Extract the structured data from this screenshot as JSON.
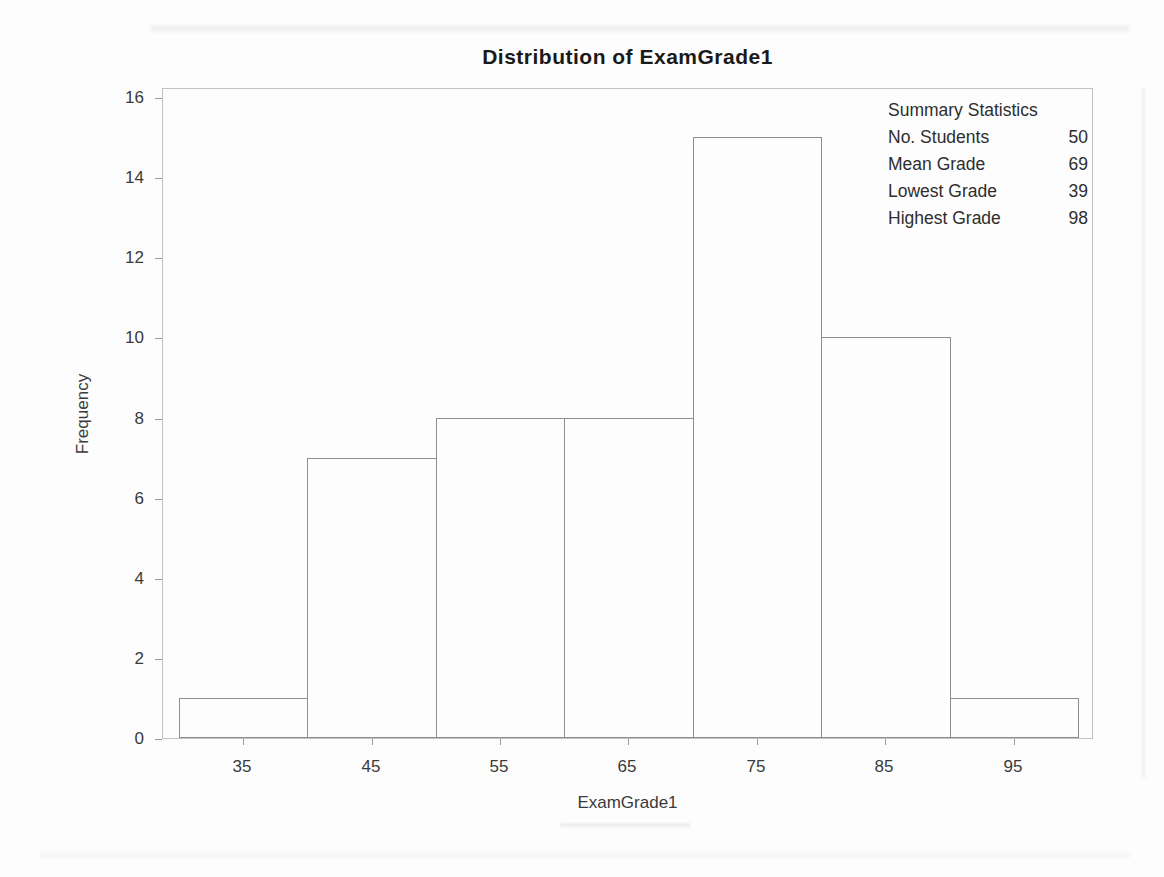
{
  "chart_data": {
    "type": "bar",
    "subtype": "histogram",
    "title": "Distribution of ExamGrade1",
    "xlabel": "ExamGrade1",
    "ylabel": "Frequency",
    "categories": [
      35,
      45,
      55,
      65,
      75,
      85,
      95
    ],
    "values": [
      1,
      7,
      8,
      8,
      15,
      10,
      1
    ],
    "bin_width": 10,
    "x_bin_edges": [
      30,
      40,
      50,
      60,
      70,
      80,
      90,
      100
    ],
    "x_tick_labels": [
      "35",
      "45",
      "55",
      "65",
      "75",
      "85",
      "95"
    ],
    "y_ticks": [
      0,
      2,
      4,
      6,
      8,
      10,
      12,
      14,
      16
    ],
    "ylim": [
      0,
      16.25
    ],
    "grid": false,
    "legend": "none",
    "colors": {
      "bar_fill": "#fdfdfd",
      "bar_outline": "#8e8e8e",
      "frame": "#c2c2c2",
      "tick": "#9a9a9a",
      "text": "#3a3a3a",
      "title_text": "#1a1a1a"
    }
  },
  "summary_panel": {
    "title": "Summary Statistics",
    "rows": [
      {
        "label": "No. Students",
        "value": "50"
      },
      {
        "label": "Mean Grade",
        "value": "69"
      },
      {
        "label": "Lowest Grade",
        "value": "39"
      },
      {
        "label": "Highest Grade",
        "value": "98"
      }
    ]
  }
}
